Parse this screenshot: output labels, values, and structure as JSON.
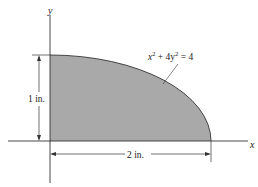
{
  "diagram": {
    "axes": {
      "x_label": "x",
      "y_label": "y"
    },
    "curve_equation": {
      "base": "x",
      "sup1": "2",
      "mid": " + 4y",
      "sup2": "2",
      "rhs": " = 4"
    },
    "dimensions": {
      "height_label": "1 in.",
      "width_label": "2 in."
    },
    "colors": {
      "fill": "#a9a9a9",
      "stroke": "#333333"
    }
  }
}
